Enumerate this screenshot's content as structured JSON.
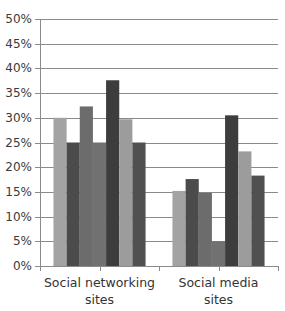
{
  "chart_data": {
    "type": "bar",
    "title": "",
    "xlabel": "",
    "ylabel": "",
    "categories": [
      "Social networking sites",
      "Social media sites"
    ],
    "category_labels": [
      [
        "Social networking",
        "sites"
      ],
      [
        "Social media",
        "sites"
      ]
    ],
    "series": [
      {
        "name": "Series 1",
        "color": "#a3a3a3",
        "values": [
          30.0,
          15.2
        ]
      },
      {
        "name": "Series 2",
        "color": "#4b4b4b",
        "values": [
          25.0,
          17.6
        ]
      },
      {
        "name": "Series 3",
        "color": "#6c6c6c",
        "values": [
          32.3,
          14.8
        ]
      },
      {
        "name": "Series 4",
        "color": "#717171",
        "values": [
          25.0,
          5.0
        ]
      },
      {
        "name": "Series 5",
        "color": "#3d3d3d",
        "values": [
          37.6,
          30.5
        ]
      },
      {
        "name": "Series 6",
        "color": "#9c9c9c",
        "values": [
          29.7,
          23.2
        ]
      },
      {
        "name": "Series 7",
        "color": "#505050",
        "values": [
          25.0,
          18.3
        ]
      }
    ],
    "ylim": [
      0,
      50
    ],
    "yticks": [
      "0%",
      "5%",
      "10%",
      "15%",
      "20%",
      "25%",
      "30%",
      "35%",
      "40%",
      "45%",
      "50%"
    ],
    "ytick_values": [
      0,
      5,
      10,
      15,
      20,
      25,
      30,
      35,
      40,
      45,
      50
    ],
    "grid": true,
    "gridline_color": "#8a8a8a",
    "axis_color": "#8a8a8a",
    "legend": null
  }
}
